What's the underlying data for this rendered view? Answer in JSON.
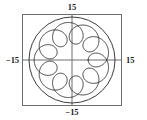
{
  "figure": {
    "title": "",
    "axis_labels": {
      "top": "15",
      "bottom": "−15",
      "left": "−15",
      "right": "15"
    }
  },
  "chart_data": {
    "type": "line",
    "title": "",
    "xlabel": "",
    "ylabel": "",
    "xlim": [
      -15,
      15
    ],
    "ylim": [
      -15,
      15
    ],
    "xticks": [
      -15,
      15
    ],
    "yticks": [
      -15,
      15
    ],
    "xticklabels": [
      "−15",
      "15"
    ],
    "yticklabels": [
      "−15",
      "15"
    ],
    "grid": false,
    "legend": null,
    "frame": "box",
    "axes_through_origin": true,
    "series": [
      {
        "name": "bounding-circle",
        "kind": "circle",
        "center": [
          0,
          0
        ],
        "radius": 15,
        "color": "#1a1a1a",
        "linewidth": 0.8
      },
      {
        "name": "epitrochoid",
        "kind": "parametric",
        "equation": "x = (R + r)cos(t) - d cos(((R + r)/r) t),  y = (R + r)sin(t) - d sin(((R + r)/r) t)",
        "parameters": {
          "R": 9,
          "r": 1,
          "d": 4,
          "loops": 9
        },
        "t_range": [
          0,
          6.283185307179586
        ],
        "color": "#1a1a1a",
        "linewidth": 0.8
      }
    ]
  },
  "colors": {
    "background": "#ffffff",
    "curve": "#1a1a1a",
    "frame": "#6e6e6e",
    "axis": "#6e6e6e",
    "text": "#1a1a1a"
  }
}
